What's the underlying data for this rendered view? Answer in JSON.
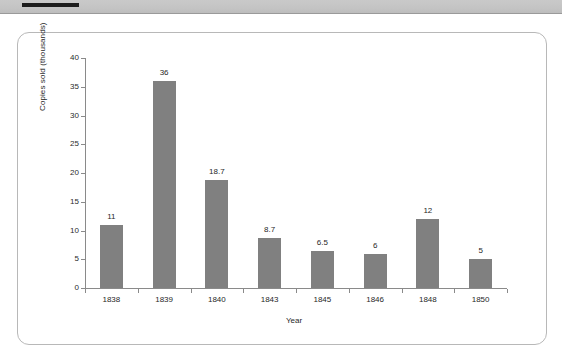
{
  "document": {
    "top_rule": "black-horizontal-rule"
  },
  "chart_data": {
    "type": "bar",
    "title": "",
    "subtitle": "",
    "xlabel": "Year",
    "ylabel": "Copies sold (thousands)",
    "categories": [
      "1838",
      "1839",
      "1840",
      "1843",
      "1845",
      "1846",
      "1848",
      "1850"
    ],
    "values": [
      11,
      36,
      18.7,
      8.7,
      6.5,
      6,
      12,
      5
    ],
    "value_labels": [
      "11",
      "36",
      "18.7",
      "8.7",
      "6.5",
      "6",
      "12",
      "5"
    ],
    "ylim": [
      0,
      40
    ],
    "yticks": [
      0,
      5,
      10,
      15,
      20,
      25,
      30,
      35,
      40
    ],
    "ytick_labels": [
      "0",
      "5",
      "10",
      "15",
      "20",
      "25",
      "30",
      "35",
      "40"
    ],
    "grid": false,
    "legend": null,
    "legend_position": "none",
    "bar_color": "#808080",
    "axis_color": "#8a8a8a",
    "text_color": "#1f1f1f",
    "series": [
      {
        "name": "Copies sold",
        "values": [
          11,
          36,
          18.7,
          8.7,
          6.5,
          6,
          12,
          5
        ]
      }
    ]
  },
  "colors": {
    "page_background": "#ffffff",
    "band_background": "#c4c4c4",
    "panel_border": "#b8b8b8",
    "rule": "#1d1d1d"
  }
}
